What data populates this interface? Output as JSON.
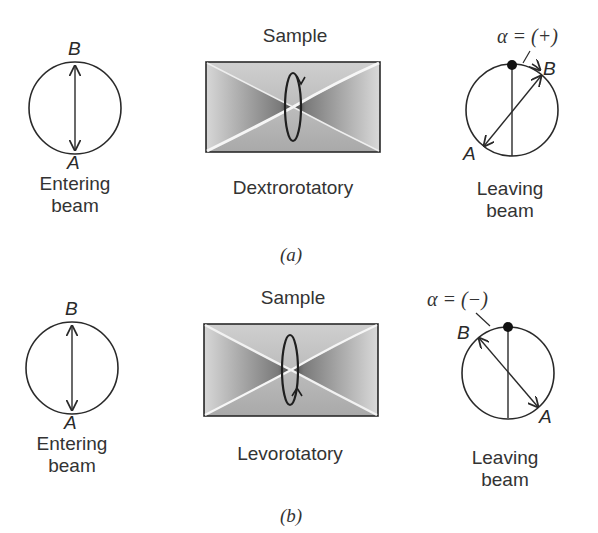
{
  "panels": [
    {
      "id": "a",
      "panel_label": "(a)",
      "entering": {
        "top_letter": "B",
        "bottom_letter": "A",
        "label_line1": "Entering",
        "label_line2": "beam"
      },
      "sample": {
        "title": "Sample",
        "type_label": "Dextrorotatory",
        "rotation": "clockwise"
      },
      "leaving": {
        "angle_label": "α = (+)",
        "letter_B": "B",
        "letter_A": "A",
        "label_line1": "Leaving",
        "label_line2": "beam"
      }
    },
    {
      "id": "b",
      "panel_label": "(b)",
      "entering": {
        "top_letter": "B",
        "bottom_letter": "A",
        "label_line1": "Entering",
        "label_line2": "beam"
      },
      "sample": {
        "title": "Sample",
        "type_label": "Levorotatory",
        "rotation": "counterclockwise"
      },
      "leaving": {
        "angle_label": "α = (−)",
        "letter_B": "B",
        "letter_A": "A",
        "label_line1": "Leaving",
        "label_line2": "beam"
      }
    }
  ],
  "colors": {
    "line": "#2a2a2a",
    "sample_fill": "#bdbdbd",
    "sample_dark": "#5a5a5a",
    "highlight": "#f4f4f4"
  }
}
